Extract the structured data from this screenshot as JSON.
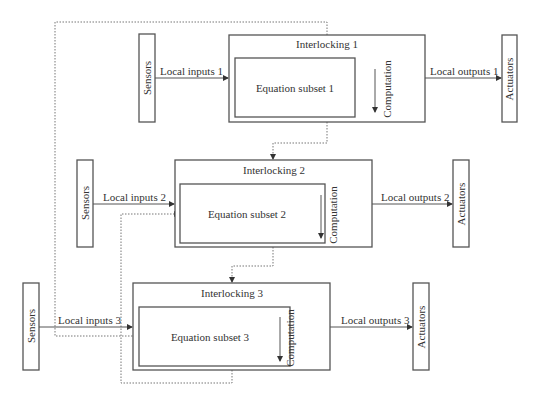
{
  "diagram": {
    "rows": [
      {
        "sensors": "Sensors",
        "inputs": "Local inputs 1",
        "interlocking": "Interlocking 1",
        "equation": "Equation subset 1",
        "computation": "Computation",
        "outputs": "Local outputs 1",
        "actuators": "Actuators"
      },
      {
        "sensors": "Sensors",
        "inputs": "Local inputs 2",
        "interlocking": "Interlocking 2",
        "equation": "Equation subset 2",
        "computation": "Computation",
        "outputs": "Local outputs 2",
        "actuators": "Actuators"
      },
      {
        "sensors": "Sensors",
        "inputs": "Local inputs 3",
        "interlocking": "Interlocking 3",
        "equation": "Equation subset 3",
        "computation": "Computation",
        "outputs": "Local outputs 3",
        "actuators": "Actuators"
      }
    ],
    "connections": [
      {
        "from": "Interlocking 1",
        "to": "Interlocking 2",
        "style": "dotted"
      },
      {
        "from": "Interlocking 2",
        "to": "Interlocking 3",
        "style": "dotted"
      },
      {
        "from": "Interlocking 3",
        "to": "Equation subset 2",
        "style": "dotted"
      },
      {
        "from": "Interlocking 1",
        "to": "Equation subset 3",
        "style": "dotted"
      }
    ]
  }
}
